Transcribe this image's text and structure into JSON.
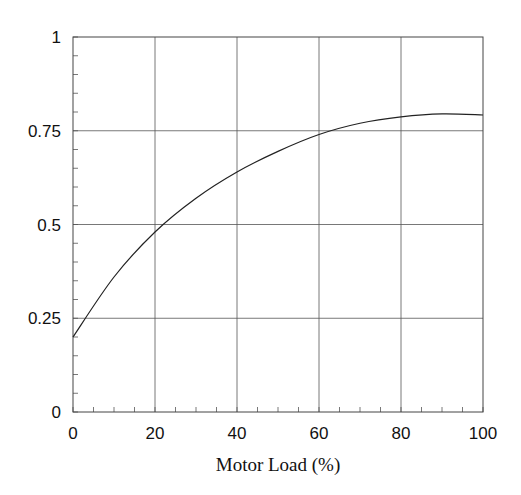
{
  "chart_data": {
    "type": "line",
    "title": "",
    "xlabel": "Motor Load (%)",
    "ylabel": "",
    "xlim": [
      0,
      100
    ],
    "ylim": [
      0,
      1
    ],
    "grid": true,
    "legend": null,
    "x_ticks": [
      0,
      20,
      40,
      60,
      80,
      100
    ],
    "x_tick_labels": [
      "0",
      "20",
      "40",
      "60",
      "80",
      "100"
    ],
    "x_minor_step": 5,
    "y_ticks": [
      0,
      0.25,
      0.5,
      0.75,
      1
    ],
    "y_tick_labels": [
      "0",
      "0.25",
      "0.5",
      "0.75",
      "1"
    ],
    "y_minor_step": 0.05,
    "series": [
      {
        "name": "curve",
        "color": "#222222",
        "x": [
          0,
          10,
          20,
          30,
          40,
          50,
          60,
          70,
          80,
          90,
          100
        ],
        "values": [
          0.2,
          0.36,
          0.48,
          0.57,
          0.64,
          0.695,
          0.74,
          0.77,
          0.787,
          0.795,
          0.792
        ]
      }
    ]
  }
}
